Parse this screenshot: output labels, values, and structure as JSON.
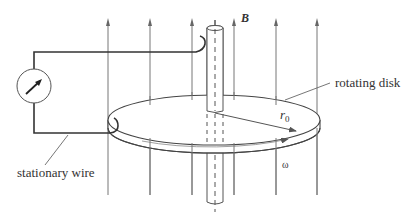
{
  "figure": {
    "labels": {
      "field": "B",
      "disk": "rotating disk",
      "wire": "stationary wire",
      "radius": "r",
      "radius_sub": "0",
      "angular_velocity": "ω"
    },
    "field_lines_count": 6,
    "colors": {
      "line": "#555555",
      "wire": "#333333",
      "arrow": "#666666",
      "background": "#ffffff"
    }
  }
}
